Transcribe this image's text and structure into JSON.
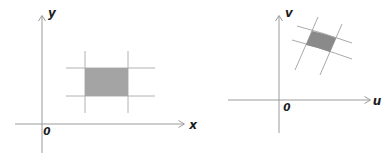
{
  "figure": {
    "panels": [
      {
        "id": "xy-plane",
        "vertical_axis_label": "y",
        "horizontal_axis_label": "x",
        "origin_label": "0",
        "region_description": "shaded axis-aligned rectangle bounded by two vertical and two horizontal gridlines that extend past its corners"
      },
      {
        "id": "uv-plane",
        "vertical_axis_label": "v",
        "horizontal_axis_label": "u",
        "origin_label": "0",
        "region_description": "shaded tilted curvilinear quadrilateral in the first quadrant bounded by two steep and two shallow crossing lines that extend past its corners"
      }
    ]
  },
  "colors": {
    "background": "#ffffff",
    "axis": "#9b9b9b",
    "gridline": "#b2b2b2",
    "boundary_curve": "#aaaaaa",
    "label": "#1c1c1c",
    "rect_fill": "#a4a4a4",
    "quad_fill": "#8a8a8a"
  }
}
